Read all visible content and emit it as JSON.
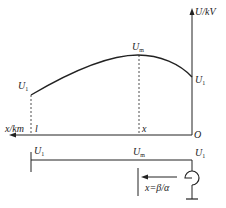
{
  "diagram": {
    "axes": {
      "y_label": "U/kV",
      "x_label": "x/km",
      "origin": "O",
      "x_end": "l",
      "x_mid": "x"
    },
    "curve_labels": {
      "left": "U",
      "left_sub": "1",
      "peak": "U",
      "peak_sub": "m",
      "right": "U",
      "right_sub": "1"
    },
    "line_labels": {
      "left": "U",
      "left_sub": "1",
      "mid": "U",
      "mid_sub": "m",
      "right": "U",
      "right_sub": "1"
    },
    "arrow_label": "x=β/α",
    "colors": {
      "stroke": "#222222"
    }
  }
}
